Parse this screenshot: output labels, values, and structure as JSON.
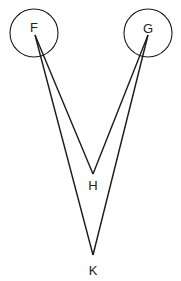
{
  "diagram": {
    "type": "geometric-figure",
    "stroke_color": "#1a1a1a",
    "nodes": [
      {
        "id": "F",
        "label": "F",
        "x": 35,
        "y": 35,
        "circle": {
          "cx": 34,
          "cy": 33,
          "r": 24
        },
        "label_x": 34,
        "label_y": 32
      },
      {
        "id": "G",
        "label": "G",
        "x": 148,
        "y": 35,
        "circle": {
          "cx": 148,
          "cy": 33,
          "r": 24
        },
        "label_x": 148,
        "label_y": 33
      },
      {
        "id": "H",
        "label": "H",
        "x": 93,
        "y": 174,
        "label_x": 93,
        "label_y": 190
      },
      {
        "id": "K",
        "label": "K",
        "x": 93,
        "y": 255,
        "label_x": 93,
        "label_y": 275
      }
    ],
    "edges": [
      {
        "from": "F",
        "to": "H"
      },
      {
        "from": "F",
        "to": "K"
      },
      {
        "from": "G",
        "to": "H"
      },
      {
        "from": "G",
        "to": "K"
      }
    ]
  }
}
